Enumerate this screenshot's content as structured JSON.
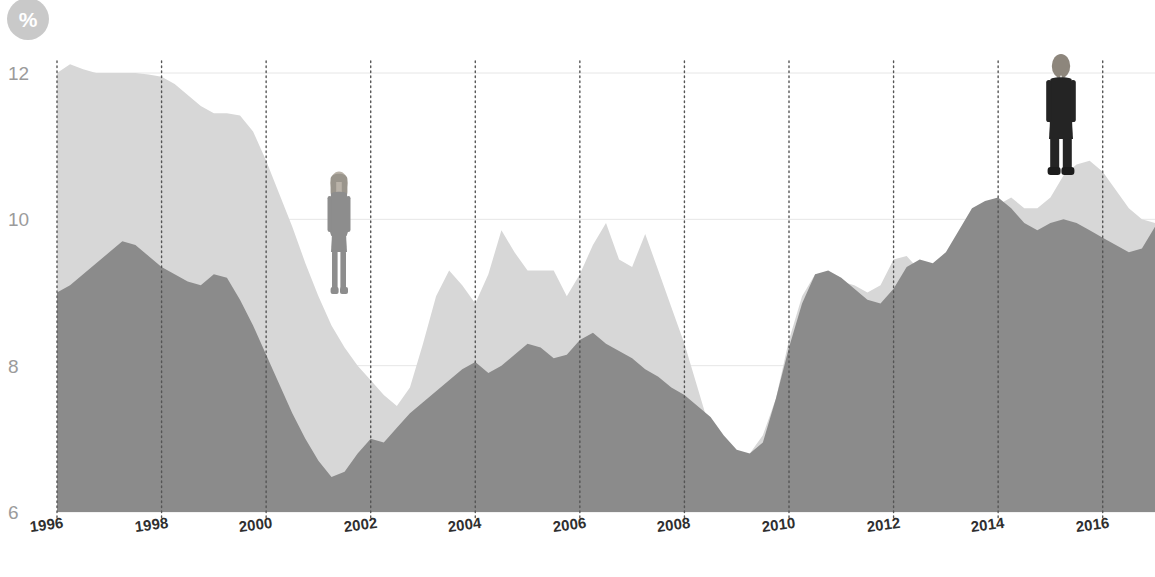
{
  "badge": {
    "icon": "percent-icon",
    "label": "%",
    "color": "#c9c9c9"
  },
  "colors": {
    "series_back": "#d7d7d7",
    "series_front": "#8b8b8b",
    "gridline": "#e6e6e6",
    "tick_dotted": "#555555",
    "y_label": "#9b9b9b",
    "x_label": "#2f2f2f",
    "background": "#ffffff",
    "figure_woman": "#8b8b8b",
    "figure_man": "#2b2b2b"
  },
  "figures": [
    {
      "name": "woman-figure",
      "year": 2001.4,
      "value": 9.0
    },
    {
      "name": "man-figure",
      "year": 2015.2,
      "value": 10.6
    }
  ],
  "chart_data": {
    "type": "area",
    "title": "",
    "subtitle": "",
    "xlabel": "",
    "ylabel": "%",
    "xlim": [
      1996,
      2017
    ],
    "ylim": [
      6,
      12
    ],
    "grid": true,
    "legend_position": "none",
    "y_ticks": [
      "12",
      "10",
      "8",
      "6"
    ],
    "y_tick_values": [
      12,
      10,
      8,
      6
    ],
    "x_ticks": [
      "1996",
      "1998",
      "2000",
      "2002",
      "2004",
      "2006",
      "2008",
      "2010",
      "2012",
      "2014",
      "2016"
    ],
    "x_tick_values": [
      1996,
      1998,
      2000,
      2002,
      2004,
      2006,
      2008,
      2010,
      2012,
      2014,
      2016
    ],
    "x": [
      1996.0,
      1996.25,
      1996.5,
      1996.75,
      1997.0,
      1997.25,
      1997.5,
      1997.75,
      1998.0,
      1998.25,
      1998.5,
      1998.75,
      1999.0,
      1999.25,
      1999.5,
      1999.75,
      2000.0,
      2000.25,
      2000.5,
      2000.75,
      2001.0,
      2001.25,
      2001.5,
      2001.75,
      2002.0,
      2002.25,
      2002.5,
      2002.75,
      2003.0,
      2003.25,
      2003.5,
      2003.75,
      2004.0,
      2004.25,
      2004.5,
      2004.75,
      2005.0,
      2005.25,
      2005.5,
      2005.75,
      2006.0,
      2006.25,
      2006.5,
      2006.75,
      2007.0,
      2007.25,
      2007.5,
      2007.75,
      2008.0,
      2008.25,
      2008.5,
      2008.75,
      2009.0,
      2009.25,
      2009.5,
      2009.75,
      2010.0,
      2010.25,
      2010.5,
      2010.75,
      2011.0,
      2011.25,
      2011.5,
      2011.75,
      2012.0,
      2012.25,
      2012.5,
      2012.75,
      2013.0,
      2013.25,
      2013.5,
      2013.75,
      2014.0,
      2014.25,
      2014.5,
      2014.75,
      2015.0,
      2015.25,
      2015.5,
      2015.75,
      2016.0,
      2016.25,
      2016.5,
      2016.75,
      2017.0
    ],
    "series": [
      {
        "name": "back-series",
        "color": "#d7d7d7",
        "values": [
          12.0,
          12.12,
          12.05,
          12.0,
          12.0,
          12.0,
          12.0,
          11.98,
          11.95,
          11.85,
          11.7,
          11.55,
          11.45,
          11.45,
          11.42,
          11.2,
          10.8,
          10.35,
          9.9,
          9.4,
          8.95,
          8.55,
          8.25,
          8.0,
          7.8,
          7.6,
          7.45,
          7.7,
          8.3,
          8.95,
          9.3,
          9.1,
          8.85,
          9.25,
          9.85,
          9.55,
          9.3,
          9.3,
          9.3,
          8.95,
          9.25,
          9.65,
          9.95,
          9.45,
          9.35,
          9.8,
          9.3,
          8.8,
          8.3,
          7.7,
          7.1,
          6.75,
          6.72,
          6.8,
          7.05,
          7.55,
          8.35,
          8.95,
          9.25,
          9.25,
          9.15,
          9.1,
          9.0,
          9.1,
          9.45,
          9.5,
          9.3,
          9.2,
          9.25,
          9.45,
          9.8,
          9.95,
          10.2,
          10.3,
          10.15,
          10.15,
          10.3,
          10.6,
          10.75,
          10.8,
          10.65,
          10.4,
          10.15,
          10.0,
          9.95
        ]
      },
      {
        "name": "front-series",
        "color": "#8b8b8b",
        "values": [
          9.0,
          9.1,
          9.25,
          9.4,
          9.55,
          9.7,
          9.65,
          9.5,
          9.35,
          9.25,
          9.15,
          9.1,
          9.25,
          9.2,
          8.9,
          8.55,
          8.15,
          7.75,
          7.35,
          7.0,
          6.7,
          6.48,
          6.55,
          6.8,
          7.0,
          6.95,
          7.15,
          7.35,
          7.5,
          7.65,
          7.8,
          7.95,
          8.05,
          7.9,
          8.0,
          8.15,
          8.3,
          8.25,
          8.1,
          8.15,
          8.35,
          8.45,
          8.3,
          8.2,
          8.1,
          7.95,
          7.85,
          7.7,
          7.6,
          7.45,
          7.3,
          7.05,
          6.85,
          6.8,
          6.95,
          7.55,
          8.25,
          8.85,
          9.25,
          9.3,
          9.2,
          9.05,
          8.9,
          8.85,
          9.05,
          9.35,
          9.45,
          9.4,
          9.55,
          9.85,
          10.15,
          10.25,
          10.3,
          10.15,
          9.95,
          9.85,
          9.95,
          10.0,
          9.95,
          9.85,
          9.75,
          9.65,
          9.55,
          9.6,
          9.9
        ]
      }
    ]
  }
}
